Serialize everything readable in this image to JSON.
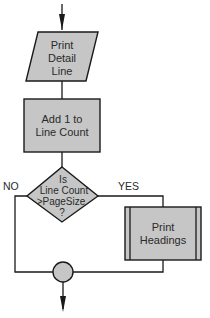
{
  "diagram": {
    "type": "flowchart",
    "colors": {
      "shape_fill": "#c6c6c6",
      "stroke": "#1a1a1a",
      "text": "#2a2a2a",
      "background": "#ffffff"
    },
    "nodes": {
      "print_detail": {
        "shape": "parallelogram",
        "lines": [
          "Print",
          "Detail",
          "Line"
        ]
      },
      "add_count": {
        "shape": "rectangle",
        "lines": [
          "Add 1 to",
          "Line Count"
        ]
      },
      "decision": {
        "shape": "diamond",
        "lines": [
          "Is",
          "Line Count",
          ">PageSize",
          "?"
        ]
      },
      "print_headings": {
        "shape": "predefined-process",
        "lines": [
          "Print",
          "Headings"
        ]
      },
      "connector": {
        "shape": "circle"
      }
    },
    "edge_labels": {
      "no": "NO",
      "yes": "YES"
    },
    "edges": [
      {
        "from": "entry",
        "to": "print_detail"
      },
      {
        "from": "print_detail",
        "to": "add_count"
      },
      {
        "from": "add_count",
        "to": "decision"
      },
      {
        "from": "decision",
        "to": "print_headings",
        "label": "YES"
      },
      {
        "from": "decision",
        "to": "connector",
        "label": "NO"
      },
      {
        "from": "print_headings",
        "to": "connector"
      },
      {
        "from": "connector",
        "to": "exit"
      }
    ]
  }
}
